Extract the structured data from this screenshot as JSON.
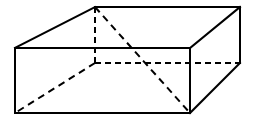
{
  "figure": {
    "shape_type": "rectangular-prism",
    "projection": "oblique",
    "canvas": {
      "width": 255,
      "height": 123
    },
    "colors": {
      "background": "#ffffff",
      "stroke": "#000000",
      "face": "#ffffff"
    },
    "stroke": {
      "solid_width": 2.0,
      "hidden_width": 2.0,
      "hidden_dash": "6 4",
      "diagonal_dash": "7 5"
    },
    "vertices": {
      "front_top_left": {
        "x": 15,
        "y": 48
      },
      "front_top_right": {
        "x": 190,
        "y": 48
      },
      "front_bottom_right": {
        "x": 190,
        "y": 113
      },
      "front_bottom_left": {
        "x": 15,
        "y": 113
      },
      "back_top_left": {
        "x": 95,
        "y": 7
      },
      "back_top_right": {
        "x": 240,
        "y": 7
      },
      "back_bottom_right": {
        "x": 240,
        "y": 63
      },
      "back_bottom_left": {
        "x": 95,
        "y": 63
      }
    },
    "edges_visible": [
      {
        "name": "front-top",
        "from": "front_top_left",
        "to": "front_top_right"
      },
      {
        "name": "front-right",
        "from": "front_top_right",
        "to": "front_bottom_right"
      },
      {
        "name": "front-bottom",
        "from": "front_bottom_right",
        "to": "front_bottom_left"
      },
      {
        "name": "front-left",
        "from": "front_bottom_left",
        "to": "front_top_left"
      },
      {
        "name": "back-top",
        "from": "back_top_left",
        "to": "back_top_right"
      },
      {
        "name": "back-right-vertical",
        "from": "back_top_right",
        "to": "back_bottom_right"
      },
      {
        "name": "top-left-connector",
        "from": "front_top_left",
        "to": "back_top_left"
      },
      {
        "name": "top-right-connector",
        "from": "front_top_right",
        "to": "back_top_right"
      },
      {
        "name": "bottom-right-connector",
        "from": "front_bottom_right",
        "to": "back_bottom_right"
      }
    ],
    "edges_hidden": [
      {
        "name": "back-left-vertical",
        "from": "back_top_left",
        "to": "back_bottom_left"
      },
      {
        "name": "back-bottom",
        "from": "back_bottom_left",
        "to": "back_bottom_right"
      }
    ],
    "diagonals_hidden": [
      {
        "name": "diagonal-back-top-left-to-front-bottom-right",
        "from": "back_top_left",
        "to": "front_bottom_right"
      },
      {
        "name": "diagonal-back-bottom-left-to-front-bottom-left",
        "from": "back_bottom_left",
        "to": "front_bottom_left"
      }
    ],
    "labels": []
  }
}
